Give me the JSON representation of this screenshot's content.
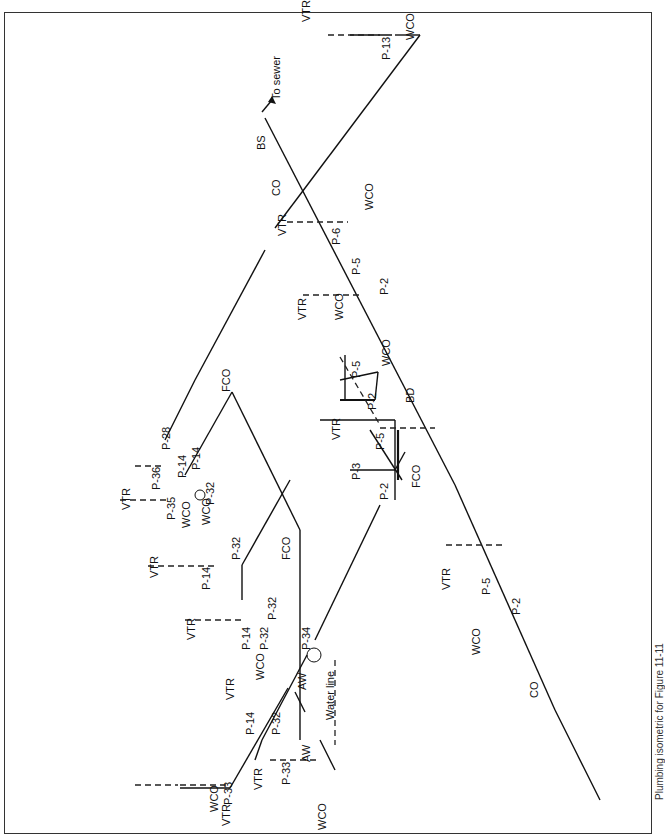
{
  "diagram": {
    "title": "Plumbing isometric for Figure 11-11",
    "orientation": "rotated -90deg",
    "labels": {
      "to_sewer": "To sewer",
      "bs": "BS",
      "co_top": "CO",
      "co_bottom": "CO",
      "bd": "BD",
      "fco_upper": "FCO",
      "fco_mid": "FCO",
      "fco_lower": "FCO",
      "aw_upper": "AW",
      "aw_lower": "AW",
      "water_line": "Water line",
      "vtr": "VTR",
      "wco": "WCO",
      "p13": "P-13",
      "p6": "P-6",
      "p5": "P-5",
      "p2": "P-2",
      "p3": "P-3",
      "p14": "P-14",
      "p28": "P-28",
      "p32": "P-32",
      "p33": "P-33",
      "p34": "P-34",
      "p35": "P-35",
      "p36": "P-36"
    },
    "legend": [
      {
        "abbr": "VTR",
        "meaning": "Vent through roof"
      },
      {
        "abbr": "WCO",
        "meaning": "Wall cleanout"
      },
      {
        "abbr": "FCO",
        "meaning": "Floor cleanout"
      },
      {
        "abbr": "CO",
        "meaning": "Cleanout"
      },
      {
        "abbr": "BS",
        "meaning": "Building sewer"
      },
      {
        "abbr": "BD",
        "meaning": "Building drain"
      },
      {
        "abbr": "AW",
        "meaning": "Water line (cold)"
      }
    ],
    "style": {
      "line_color": "#111111",
      "background": "#ffffff",
      "border": "#333333"
    }
  }
}
